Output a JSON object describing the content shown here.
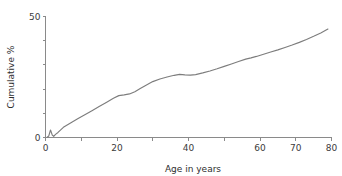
{
  "chart_data": {
    "type": "line",
    "title": "",
    "xlabel": "Age in years",
    "ylabel": "Cumulative %",
    "xlim": [
      0,
      80
    ],
    "ylim": [
      0,
      50
    ],
    "grid": false,
    "legend": null,
    "line_color": "#7d7d7d",
    "axis_color": "#8a8a8a",
    "background_color": "#ffffff",
    "x_ticks": [
      0,
      10,
      20,
      30,
      40,
      50,
      60,
      70,
      80
    ],
    "x_tick_labels": [
      "0",
      "",
      "20",
      "",
      "40",
      "",
      "60",
      "70",
      "80"
    ],
    "y_ticks": [
      0,
      10,
      20,
      30,
      40,
      50
    ],
    "y_tick_labels": [
      "0",
      "",
      "",
      "",
      "",
      "50"
    ],
    "series": [
      {
        "name": "Cumulative %",
        "x": [
          0.4,
          0.9,
          1.4,
          1.9,
          2.3,
          2.8,
          3.5,
          5,
          7,
          9,
          11,
          13,
          15,
          17,
          19,
          20.5,
          22,
          23.5,
          25,
          26.5,
          28,
          30,
          32,
          34,
          36,
          37.5,
          39,
          40.5,
          42,
          44,
          46,
          48,
          50,
          52,
          54,
          56,
          57.5,
          59,
          61,
          63,
          65,
          67,
          69,
          71,
          73,
          75,
          77,
          79
        ],
        "y": [
          0.0,
          0.6,
          3.1,
          1.0,
          0.5,
          1.3,
          2.1,
          4.2,
          6.0,
          7.7,
          9.4,
          11.1,
          12.8,
          14.5,
          16.2,
          17.3,
          17.6,
          18.0,
          18.9,
          20.2,
          21.5,
          23.1,
          24.2,
          25.0,
          25.7,
          26.1,
          25.9,
          25.8,
          26.0,
          26.7,
          27.5,
          28.4,
          29.4,
          30.4,
          31.4,
          32.4,
          32.9,
          33.5,
          34.4,
          35.3,
          36.2,
          37.2,
          38.2,
          39.3,
          40.5,
          41.8,
          43.2,
          44.8
        ]
      }
    ]
  },
  "figure": {
    "name": "cumulative-percent-by-age-chart"
  }
}
